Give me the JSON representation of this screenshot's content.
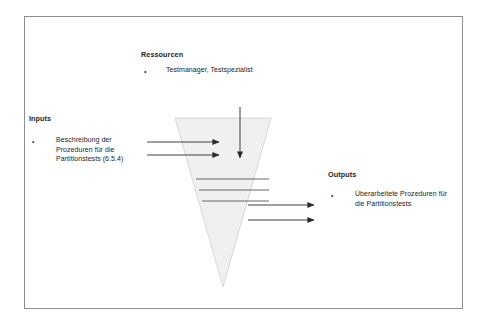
{
  "diagram": {
    "title_note": "IPO (Input-Process-Output) funnel diagram",
    "frame": {
      "border_color": "#8d8d8d"
    },
    "funnel": {
      "name": "inverted-triangle",
      "fill_color": "#f0f0f0",
      "stroke_color": "#d2d2d2",
      "internal_line_color": "#5a5a5a",
      "internal_line_count": 3
    },
    "arrow_color": "#2b2b2b"
  },
  "resources": {
    "heading": "Ressourcen",
    "bullet_glyph": "•",
    "items": [
      "Testmanager, Testspezialist"
    ]
  },
  "inputs": {
    "heading": "Inputs",
    "bullet_glyph": "•",
    "items": [
      "Beschreibung der\nProzeduren für die\nPartitionstests (6.5.4)"
    ],
    "arrow_count": 2
  },
  "outputs": {
    "heading": "Outputs",
    "bullet_glyph": "•",
    "items": [
      "Überarbeitete Prozeduren für\ndie Partitionstests"
    ],
    "arrow_count": 2
  }
}
